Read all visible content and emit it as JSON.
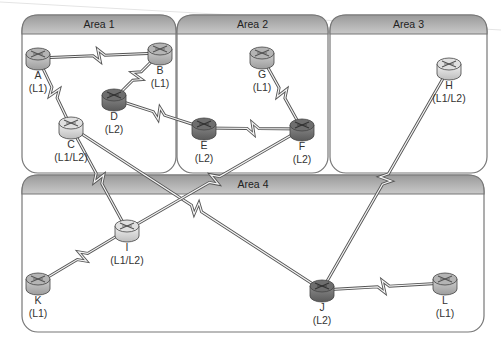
{
  "diagram": {
    "type": "network-topology",
    "colors": {
      "area_border": "#777777",
      "area_header_top": "#9a9a9a",
      "area_header_bottom": "#c8c8c8",
      "link": "#555555",
      "router_l1": "#bdbdbd",
      "router_l2": "#7a7a7a",
      "router_l1l2": "#e6e6e6"
    },
    "areas": [
      {
        "id": "area1",
        "title": "Area 1",
        "x": 22,
        "y": 15,
        "w": 154,
        "h": 158
      },
      {
        "id": "area2",
        "title": "Area 2",
        "x": 177,
        "y": 15,
        "w": 151,
        "h": 158
      },
      {
        "id": "area3",
        "title": "Area 3",
        "x": 330,
        "y": 15,
        "w": 157,
        "h": 158
      },
      {
        "id": "area4",
        "title": "Area 4",
        "x": 22,
        "y": 175,
        "w": 462,
        "h": 157
      }
    ],
    "routers": [
      {
        "id": "A",
        "name": "A",
        "level": "(L1)",
        "x": 38,
        "y": 58,
        "kind": "l1"
      },
      {
        "id": "B",
        "name": "B",
        "level": "(L1)",
        "x": 160,
        "y": 53,
        "kind": "l1"
      },
      {
        "id": "C",
        "name": "C",
        "level": "(L1/L2)",
        "x": 71,
        "y": 127,
        "kind": "l1l2"
      },
      {
        "id": "D",
        "name": "D",
        "level": "(L2)",
        "x": 114,
        "y": 99,
        "kind": "l2"
      },
      {
        "id": "E",
        "name": "E",
        "level": "(L2)",
        "x": 204,
        "y": 128,
        "kind": "l2"
      },
      {
        "id": "F",
        "name": "F",
        "level": "(L2)",
        "x": 302,
        "y": 129,
        "kind": "l2"
      },
      {
        "id": "G",
        "name": "G",
        "level": "(L1)",
        "x": 262,
        "y": 57,
        "kind": "l1"
      },
      {
        "id": "H",
        "name": "H",
        "level": "(L1/L2)",
        "x": 449,
        "y": 68,
        "kind": "l1l2"
      },
      {
        "id": "I",
        "name": "I",
        "level": "(L1/L2)",
        "x": 127,
        "y": 230,
        "kind": "l1l2"
      },
      {
        "id": "K",
        "name": "K",
        "level": "(L1)",
        "x": 38,
        "y": 283,
        "kind": "l1"
      },
      {
        "id": "J",
        "name": "J",
        "level": "(L2)",
        "x": 322,
        "y": 290,
        "kind": "l2"
      },
      {
        "id": "L",
        "name": "L",
        "level": "(L1)",
        "x": 445,
        "y": 283,
        "kind": "l1"
      }
    ],
    "links": [
      {
        "from": "A",
        "to": "B"
      },
      {
        "from": "A",
        "to": "C"
      },
      {
        "from": "B",
        "to": "D"
      },
      {
        "from": "D",
        "to": "E"
      },
      {
        "from": "E",
        "to": "F"
      },
      {
        "from": "G",
        "to": "F"
      },
      {
        "from": "C",
        "to": "I"
      },
      {
        "from": "C",
        "to": "J"
      },
      {
        "from": "F",
        "to": "I"
      },
      {
        "from": "I",
        "to": "K"
      },
      {
        "from": "H",
        "to": "J"
      },
      {
        "from": "J",
        "to": "L"
      }
    ]
  }
}
